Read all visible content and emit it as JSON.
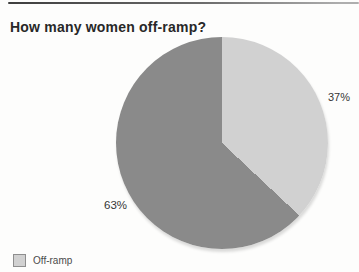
{
  "chart_data": {
    "type": "pie",
    "title": "How many women off-ramp?",
    "unit": "percent",
    "start_angle_deg": 0,
    "direction": "clockwise",
    "slices": [
      {
        "label": "Off-ramp",
        "value": 37,
        "display_label": "37%",
        "color": "#d1d1d1"
      },
      {
        "label": "",
        "value": 63,
        "display_label": "63%",
        "color": "#8a8a8a"
      }
    ],
    "legend": {
      "position": "bottom-left",
      "items": [
        {
          "label": "Off-ramp",
          "color": "#d1d1d1"
        }
      ]
    }
  },
  "decor": {
    "rule_color_left": "#3e3e3e",
    "rule_color_right": "#aeaeae"
  }
}
